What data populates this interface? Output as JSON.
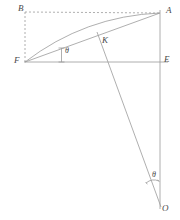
{
  "figure": {
    "type": "geometric-diagram",
    "title": "",
    "background_color": "#ffffff",
    "stroke_color": "#8a8a8a",
    "label_color": "#4a4a4a",
    "points": [
      {
        "id": "B",
        "label": "B",
        "x": 25,
        "y": 12,
        "label_x": 18,
        "label_y": 4
      },
      {
        "id": "A",
        "label": "A",
        "x": 160,
        "y": 13,
        "label_x": 166,
        "label_y": 6
      },
      {
        "id": "F",
        "label": "F",
        "x": 25,
        "y": 62,
        "label_x": 14,
        "label_y": 56
      },
      {
        "id": "E",
        "label": "E",
        "x": 160,
        "y": 62,
        "label_x": 164,
        "label_y": 55
      },
      {
        "id": "K",
        "label": "K",
        "x": 105,
        "y": 35,
        "label_x": 102,
        "label_y": 36
      },
      {
        "id": "O",
        "label": "O",
        "x": 160,
        "y": 205,
        "label_x": 162,
        "label_y": 205
      }
    ],
    "angles": [
      {
        "id": "theta-F",
        "label": "θ",
        "label_x": 65,
        "label_y": 46,
        "vertex": "F"
      },
      {
        "id": "theta-O",
        "label": "θ",
        "label_x": 152,
        "label_y": 171,
        "vertex": "O"
      }
    ],
    "segments": [
      {
        "id": "BF-dashed",
        "from": "B",
        "to": "F",
        "style": "dashed"
      },
      {
        "id": "BA-dashed",
        "from": "B",
        "to": "A",
        "style": "dashed"
      },
      {
        "id": "FE-horizontal",
        "from": "F",
        "to": "E",
        "style": "solid"
      },
      {
        "id": "AE-vertical",
        "from": "A",
        "to": "E",
        "style": "solid"
      },
      {
        "id": "FA-chord",
        "from": "F",
        "to": "A",
        "style": "solid"
      },
      {
        "id": "FA-arc",
        "from": "F",
        "to": "A",
        "style": "arc"
      },
      {
        "id": "A-to-O",
        "from": "A",
        "to": "O",
        "style": "solid"
      },
      {
        "id": "E-to-O-vertical",
        "from": "E",
        "to": "O",
        "style": "solid"
      },
      {
        "id": "theta-tick-F",
        "from": "F-tick-top",
        "to": "F-tick-bottom",
        "style": "solid-ticked"
      },
      {
        "id": "theta-arc-O",
        "from": "O-ray-1",
        "to": "O-ray-2",
        "style": "arc-marker"
      }
    ]
  }
}
